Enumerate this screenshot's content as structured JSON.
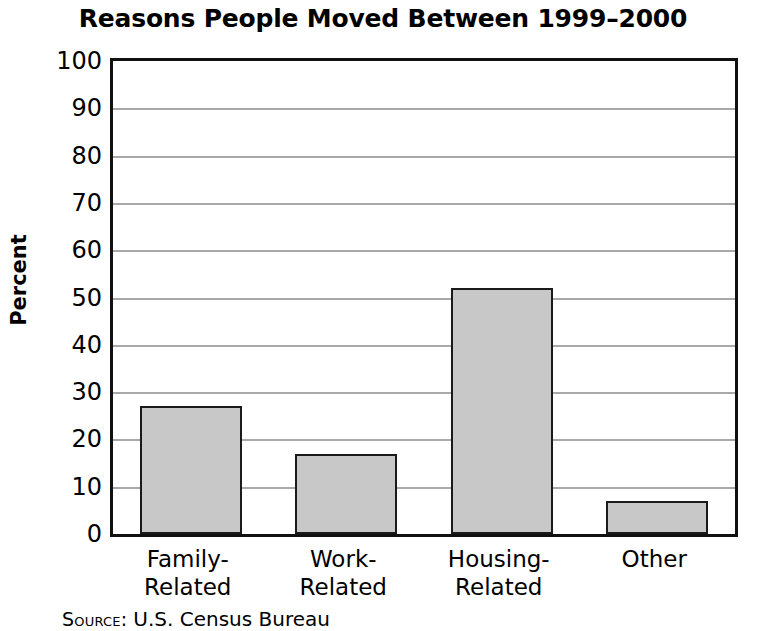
{
  "chart_data": {
    "type": "bar",
    "title": "Reasons People Moved Between 1999–2000",
    "xlabel": "",
    "ylabel": "Percent",
    "categories": [
      "Family-\nRelated",
      "Work-\nRelated",
      "Housing-\nRelated",
      "Other"
    ],
    "category_lines": [
      [
        "Family-",
        "Related"
      ],
      [
        "Work-",
        "Related"
      ],
      [
        "Housing-",
        "Related"
      ],
      [
        "Other",
        ""
      ]
    ],
    "values": [
      27,
      17,
      52,
      7
    ],
    "ylim": [
      0,
      100
    ],
    "ytick_labels": [
      "100",
      "90",
      "80",
      "70",
      "60",
      "50",
      "40",
      "30",
      "20",
      "10",
      "0"
    ],
    "ytick_values": [
      100,
      90,
      80,
      70,
      60,
      50,
      40,
      30,
      20,
      10,
      0
    ],
    "grid": true,
    "legend": null,
    "bar_color": "#c8c8c8",
    "bar_edge_color": "#1a1a1a",
    "gridline_color": "#a9a9a9",
    "frame_color": "#111111"
  },
  "source": {
    "label": "Source:",
    "value": "U.S. Census Bureau"
  }
}
